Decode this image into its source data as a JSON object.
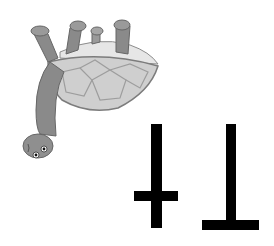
{
  "card": {
    "letters": "Tt",
    "orientation": "upside-down",
    "illustration": "turtle-upside-down",
    "colors": {
      "background": "#ffffff",
      "ink": "#000000",
      "turtle_skin": "#8a8a8a",
      "turtle_shell": "#c8c8c8",
      "shell_plates": "#a9a9a9"
    }
  }
}
